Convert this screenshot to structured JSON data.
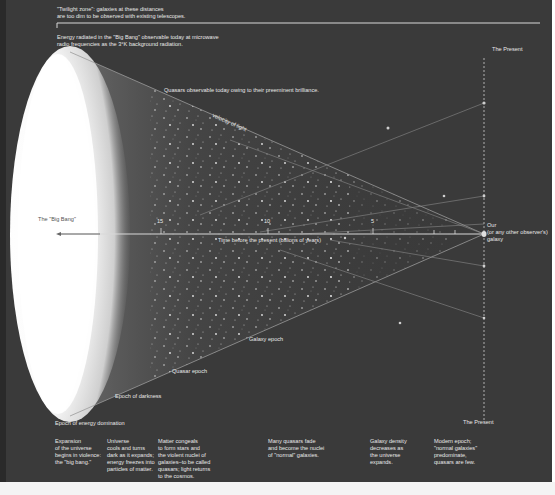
{
  "header": {
    "twilight_zone": "\"Twilight zone\": galaxies at these distances\nare too dim to be observed with existing telescopes.",
    "energy_radiated": "Energy radiated in the \"Big Bang\" observable today at microwave\nradio frequencies as the 3°K background radiation."
  },
  "labels": {
    "quasars_observable": "Quasars observable today owing to their preeminent brilliance.",
    "velocity_of_light": "velocity of light",
    "big_bang": "The \"Big Bang\"",
    "time_axis": "Time before the present (billions of years)",
    "present_top": "The Present",
    "present_bottom": "The Present",
    "our_galaxy": "Our\n(or any other observer's)\ngalaxy",
    "galaxy_epoch": "Galaxy epoch",
    "quasar_epoch": "Quasar epoch",
    "epoch_darkness": "Epoch of darkness",
    "epoch_energy": "Epoch of energy domination"
  },
  "axis": {
    "ticks": [
      {
        "label": "15",
        "x": 161
      },
      {
        "label": "10",
        "x": 268
      },
      {
        "label": "5",
        "x": 373
      }
    ]
  },
  "captions": [
    {
      "text": "Expansion\nof the universe\nbegins in violence:\nthe \"big bang.\"",
      "x": 55
    },
    {
      "text": "Universe\ncools and turns\ndark as it expands;\nenergy freezes into\nparticles of matter.",
      "x": 107
    },
    {
      "text": "Matter congeals\nto form stars and\nthe violent nuclei of\ngalaxies–to be called\nquasars; light returns\nto the cosmos.",
      "x": 158
    },
    {
      "text": "Many quasars fade\nand become the nuclei\nof \"normal\" galaxies.",
      "x": 268
    },
    {
      "text": "Galaxy density\ndecreases as\nthe universe\nexpands.",
      "x": 370
    },
    {
      "text": "Modern epoch;\n\"normal galaxies\"\npredominate,\nquasars are few.",
      "x": 434
    }
  ],
  "colors": {
    "background": "#3a3a3a",
    "text": "#e8e8e8",
    "glow": "#ffffff"
  }
}
